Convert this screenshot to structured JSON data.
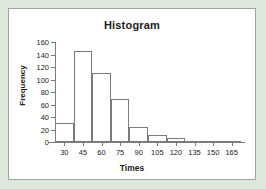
{
  "panel": {
    "background_color": "#dce8dc",
    "plot_background_color": "#ffffff",
    "border_color": "#9aa69a"
  },
  "chart_data": {
    "type": "bar",
    "title": "Histogram",
    "xlabel": "Times",
    "ylabel": "Frequency",
    "grid": false,
    "legend": false,
    "ylim": [
      0,
      160
    ],
    "xlim": [
      22.5,
      172.5
    ],
    "bin_width": 15,
    "bin_starts": [
      22.5,
      37.5,
      52.5,
      67.5,
      82.5,
      97.5,
      112.5,
      127.5,
      142.5,
      157.5
    ],
    "categories": [
      "30",
      "45",
      "60",
      "75",
      "90",
      "105",
      "120",
      "135",
      "150",
      "165"
    ],
    "values": [
      31,
      146,
      110,
      69,
      24,
      11,
      6,
      2,
      0,
      1
    ],
    "ytick_labels": [
      "0",
      "20",
      "40",
      "60",
      "80",
      "100",
      "120",
      "140",
      "160"
    ],
    "ytick_values": [
      0,
      20,
      40,
      60,
      80,
      100,
      120,
      140,
      160
    ],
    "xtick_labels": [
      "30",
      "45",
      "60",
      "75",
      "90",
      "105",
      "120",
      "135",
      "150",
      "165"
    ],
    "xtick_values": [
      30,
      45,
      60,
      75,
      90,
      105,
      120,
      135,
      150,
      165
    ],
    "bar_fill_color": "#ffffff",
    "bar_edge_color": "#7b7b7b",
    "axis_color": "#7b7b7b",
    "text_color": "#1c1c1c"
  }
}
